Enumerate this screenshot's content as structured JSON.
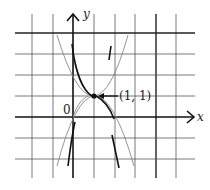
{
  "diagram": {
    "origin_label": "0",
    "x_axis_label": "x",
    "y_axis_label": "y",
    "point_label": "(1, 1)",
    "point": {
      "x": 1,
      "y": 1
    },
    "grid": {
      "x_range": [
        -2,
        6
      ],
      "y_range": [
        -3,
        4
      ],
      "unit": "1 cell"
    },
    "curves": [
      {
        "name": "upward-parabola",
        "style": "thin",
        "description": "parabola opening upward, tangent at (1,1)"
      },
      {
        "name": "downward-parabola",
        "style": "thin",
        "description": "parabola opening downward, tangent at (1,1)"
      },
      {
        "name": "steep-upper-curve",
        "style": "bold",
        "description": "bold curve segments above (1,1)"
      },
      {
        "name": "steep-lower-curve",
        "style": "bold",
        "description": "bold curve segments below (1,1)"
      }
    ],
    "colors": {
      "grid": "#555555",
      "axis": "#111111",
      "thin_curve": "#888888",
      "bold_curve": "#111111",
      "background": "#ffffff"
    }
  }
}
